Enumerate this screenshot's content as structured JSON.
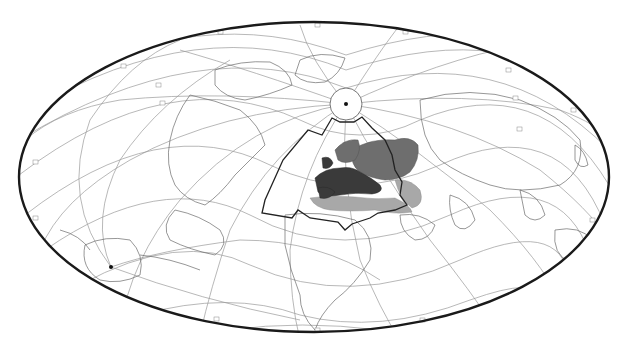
{
  "map": {
    "projection": "oblique equal-area ellipse (Hammer/Aitoff-like)",
    "frame": {
      "cx": 314,
      "cy": 177,
      "rx": 295,
      "ry": 155
    },
    "north_pole": {
      "x": 346,
      "y": 104,
      "cap_radius": 16
    },
    "south_pole": {
      "x": 111,
      "y": 267
    },
    "colors": {
      "frame": "#1a1a1a",
      "graticule": "#9a9a9a",
      "coastline": "#6a6a6a",
      "region_dark": "#3a3a3a",
      "region_mid": "#6e6e6e",
      "region_light": "#a8a8a8",
      "boundary": "#222222"
    },
    "legend": {
      "region_dark": "Western / Central Europe (dark shading)",
      "region_mid": "Eastern Europe / Scandinavia (medium shading)",
      "region_light": "North Africa / Middle East (light shading)",
      "boundary": "Study-area outline polygon"
    }
  }
}
